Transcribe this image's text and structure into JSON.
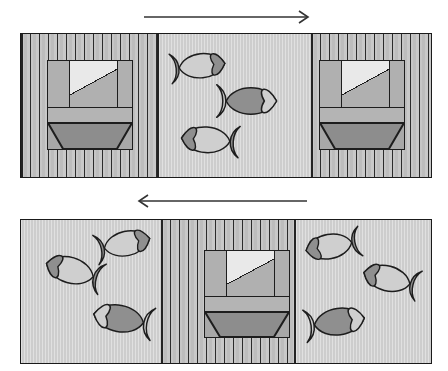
{
  "figure": {
    "type": "two-panel schematic diagram",
    "background_color": "#ffffff",
    "stroke_color": "#1d1d1d"
  },
  "colors": {
    "water_fill": "#cdcdcd",
    "block_stripe_dark": "#2c2c2c",
    "block_stripe_light": "#c6c6c6",
    "emblem_fill": "#b9b9b9",
    "emblem_light_triangle": "#e9e9e9",
    "emblem_dark_trapezoid": "#8d8d8d",
    "fish_light": "#cfcfcf",
    "fish_dark": "#8f8f8f",
    "outline": "#1d1d1d",
    "arrow": "#333333"
  },
  "panels": [
    {
      "id": "top-panel",
      "name": "upper-frame",
      "x": 20,
      "y": 33,
      "width": 412,
      "height": 145,
      "arrow": {
        "name": "arrow-right",
        "direction": "right",
        "x1": 144,
        "x2": 307,
        "y": 17
      },
      "regions": [
        {
          "kind": "striped-block",
          "name": "left-block",
          "x": 0,
          "width": 138
        },
        {
          "kind": "water",
          "name": "center-water",
          "x": 138,
          "width": 152
        },
        {
          "kind": "striped-block",
          "name": "right-block",
          "x": 290,
          "width": 122
        }
      ],
      "emblems": [
        {
          "name": "emblem-left",
          "x": 26,
          "y": 26,
          "width": 86,
          "height": 90
        },
        {
          "name": "emblem-right",
          "x": 298,
          "y": 26,
          "width": 86,
          "height": 90
        }
      ],
      "fish": [
        {
          "name": "fish-1",
          "x": 168,
          "y": 46,
          "w": 62,
          "h": 40,
          "facing": "left",
          "body": "light",
          "head": "dark",
          "tail": "dark",
          "rotate": -6
        },
        {
          "name": "fish-2",
          "x": 214,
          "y": 79,
          "w": 68,
          "h": 44,
          "facing": "left",
          "body": "dark",
          "head": "light",
          "tail": "light",
          "rotate": 0
        },
        {
          "name": "fish-3",
          "x": 176,
          "y": 119,
          "w": 66,
          "h": 42,
          "facing": "right",
          "body": "light",
          "head": "dark",
          "tail": "dark",
          "rotate": 4
        }
      ]
    },
    {
      "id": "bottom-panel",
      "name": "lower-frame",
      "x": 20,
      "y": 219,
      "width": 412,
      "height": 145,
      "arrow": {
        "name": "arrow-left",
        "direction": "left",
        "x1": 140,
        "x2": 307,
        "y": 201
      },
      "regions": [
        {
          "kind": "water",
          "name": "left-water",
          "x": 0,
          "width": 140
        },
        {
          "kind": "striped-block",
          "name": "center-block",
          "x": 140,
          "width": 135
        },
        {
          "kind": "water",
          "name": "right-water",
          "x": 275,
          "width": 137
        }
      ],
      "emblems": [
        {
          "name": "emblem-center",
          "x": 183,
          "y": 30,
          "width": 86,
          "height": 88
        }
      ],
      "fish": [
        {
          "name": "fish-4",
          "x": 40,
          "y": 250,
          "w": 66,
          "h": 42,
          "facing": "right",
          "body": "light",
          "head": "dark",
          "tail": "dark",
          "rotate": 16
        },
        {
          "name": "fish-5",
          "x": 92,
          "y": 224,
          "w": 64,
          "h": 40,
          "facing": "left",
          "body": "light",
          "head": "dark",
          "tail": "dark",
          "rotate": -12
        },
        {
          "name": "fish-6",
          "x": 88,
          "y": 297,
          "w": 68,
          "h": 44,
          "facing": "right",
          "body": "dark",
          "head": "light",
          "tail": "light",
          "rotate": 10
        },
        {
          "name": "fish-7",
          "x": 300,
          "y": 226,
          "w": 64,
          "h": 40,
          "facing": "right",
          "body": "light",
          "head": "dark",
          "tail": "dark",
          "rotate": -10
        },
        {
          "name": "fish-8",
          "x": 358,
          "y": 258,
          "w": 64,
          "h": 42,
          "facing": "right",
          "body": "light",
          "head": "dark",
          "tail": "dark",
          "rotate": 14
        },
        {
          "name": "fish-9",
          "x": 302,
          "y": 300,
          "w": 68,
          "h": 44,
          "facing": "left",
          "body": "dark",
          "head": "light",
          "tail": "light",
          "rotate": -8
        }
      ]
    }
  ]
}
